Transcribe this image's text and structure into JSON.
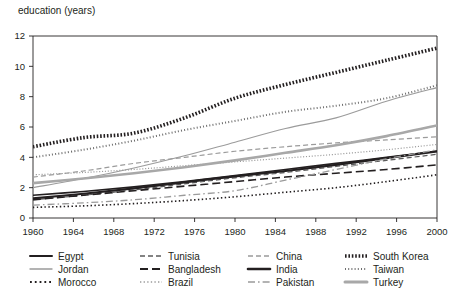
{
  "chart_data": {
    "type": "line",
    "title": "",
    "ylabel": "education (years)",
    "xlabel": "",
    "xlim": [
      1960,
      2000
    ],
    "ylim": [
      0,
      12
    ],
    "ytick_step": 2,
    "xtick_step": 4,
    "xticks": [
      1960,
      1964,
      1968,
      1972,
      1976,
      1980,
      1984,
      1988,
      1992,
      1996,
      2000
    ],
    "yticks": [
      0,
      2,
      4,
      6,
      8,
      10,
      12
    ],
    "grid": false,
    "legend_position": "bottom",
    "x": [
      1960,
      1965,
      1970,
      1975,
      1980,
      1985,
      1990,
      1995,
      2000
    ],
    "series": [
      {
        "name": "Egypt",
        "style": "solid",
        "color": "#231f20",
        "width": 1.6,
        "values": [
          1.5,
          1.75,
          2.05,
          2.4,
          2.8,
          3.2,
          3.6,
          4.0,
          4.4
        ]
      },
      {
        "name": "Jordan",
        "style": "solid",
        "color": "#9b9b9b",
        "width": 1.1,
        "values": [
          2.0,
          2.6,
          3.3,
          4.1,
          5.0,
          5.9,
          6.6,
          7.7,
          8.6
        ]
      },
      {
        "name": "Morocco",
        "style": "dotted",
        "color": "#231f20",
        "width": 1.6,
        "values": [
          0.7,
          0.8,
          0.95,
          1.15,
          1.4,
          1.7,
          2.0,
          2.4,
          2.85
        ]
      },
      {
        "name": "Tunisia",
        "style": "dashed",
        "color": "#5b5b5b",
        "width": 1.2,
        "values": [
          1.2,
          1.5,
          1.85,
          2.25,
          2.65,
          3.0,
          3.4,
          3.8,
          4.2
        ]
      },
      {
        "name": "Bangladesh",
        "style": "longdash",
        "color": "#231f20",
        "width": 1.6,
        "values": [
          1.2,
          1.5,
          1.8,
          2.1,
          2.4,
          2.7,
          2.95,
          3.2,
          3.5
        ]
      },
      {
        "name": "Brazil",
        "style": "dotted",
        "color": "#9b9b9b",
        "width": 1.2,
        "values": [
          2.85,
          3.0,
          3.2,
          3.45,
          3.7,
          3.95,
          4.2,
          4.5,
          4.85
        ]
      },
      {
        "name": "China",
        "style": "dashed",
        "color": "#9b9b9b",
        "width": 1.2,
        "values": [
          2.7,
          3.1,
          3.6,
          4.0,
          4.4,
          4.7,
          4.95,
          5.15,
          5.35
        ]
      },
      {
        "name": "India",
        "style": "solid",
        "color": "#231f20",
        "width": 2.2,
        "values": [
          1.3,
          1.6,
          1.95,
          2.35,
          2.75,
          3.1,
          3.5,
          3.95,
          4.4
        ]
      },
      {
        "name": "Pakistan",
        "style": "dashdot",
        "color": "#9b9b9b",
        "width": 1.3,
        "values": [
          0.85,
          1.0,
          1.2,
          1.5,
          1.8,
          2.5,
          3.2,
          3.9,
          4.5
        ]
      },
      {
        "name": "South Korea",
        "style": "thickdot",
        "color": "#231f20",
        "width": 3.6,
        "values": [
          4.7,
          5.3,
          5.6,
          6.6,
          7.9,
          8.8,
          9.6,
          10.4,
          11.2
        ]
      },
      {
        "name": "Taiwan",
        "style": "finedot",
        "color": "#6e6e6e",
        "width": 2.0,
        "values": [
          4.0,
          4.5,
          5.1,
          5.8,
          6.4,
          7.0,
          7.4,
          7.9,
          8.75
        ]
      },
      {
        "name": "Turkey",
        "style": "solid",
        "color": "#a8a8a8",
        "width": 2.6,
        "values": [
          2.3,
          2.6,
          2.95,
          3.35,
          3.8,
          4.3,
          4.8,
          5.4,
          6.1
        ]
      }
    ]
  },
  "legend": {
    "columns": [
      [
        {
          "label": "Egypt",
          "marker": "solid",
          "color": "#231f20",
          "width": 2
        },
        {
          "label": "Jordan",
          "marker": "solid",
          "color": "#9b9b9b",
          "width": 1.4
        },
        {
          "label": "Morocco",
          "marker": "dotted",
          "color": "#231f20",
          "width": 2
        }
      ],
      [
        {
          "label": "Tunisia",
          "marker": "dashed",
          "color": "#5b5b5b",
          "width": 1.5
        },
        {
          "label": "Bangladesh",
          "marker": "longdash",
          "color": "#231f20",
          "width": 2
        },
        {
          "label": "Brazil",
          "marker": "dotted",
          "color": "#9b9b9b",
          "width": 1.5
        }
      ],
      [
        {
          "label": "China",
          "marker": "dashed",
          "color": "#9b9b9b",
          "width": 1.5
        },
        {
          "label": "India",
          "marker": "solid",
          "color": "#231f20",
          "width": 2.6
        },
        {
          "label": "Pakistan",
          "marker": "dashdot",
          "color": "#9b9b9b",
          "width": 1.5
        }
      ],
      [
        {
          "label": "South Korea",
          "marker": "thickdot",
          "color": "#231f20",
          "width": 3.4
        },
        {
          "label": "Taiwan",
          "marker": "finedot",
          "color": "#6e6e6e",
          "width": 2.2
        },
        {
          "label": "Turkey",
          "marker": "solid",
          "color": "#a8a8a8",
          "width": 3
        }
      ]
    ]
  },
  "axis": {
    "frame_color": "#231f20",
    "tick_color": "#231f20"
  }
}
